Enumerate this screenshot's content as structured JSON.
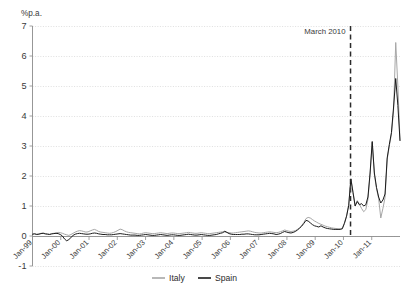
{
  "chart_data": {
    "type": "line",
    "title": "",
    "subtitle": "",
    "xlabel": "",
    "ylabel": "%p.a.",
    "y_unit_label": "%p.a.",
    "ylim": [
      -1,
      7
    ],
    "yticks": [
      -1,
      0,
      1,
      2,
      3,
      4,
      5,
      6,
      7
    ],
    "ytick_labels": [
      "-1",
      "0",
      "1",
      "2",
      "3",
      "4",
      "5",
      "6",
      "7"
    ],
    "grid": "horizontal-dotted",
    "legend_position": "bottom-center",
    "xlim": [
      "Jan-99",
      "Dec-11"
    ],
    "xticks": [
      "Jan-99",
      "Jan-00",
      "Jan-01",
      "Jan-02",
      "Jan-03",
      "Jan-04",
      "Jan-05",
      "Jan-06",
      "Jan-07",
      "Jan-08",
      "Jan-09",
      "Jan-10",
      "Jan-11"
    ],
    "x_start_year": 1999,
    "x_end_year": 2012,
    "annotations": [
      {
        "text": "March 2010",
        "x": "Mar-10",
        "x_fraction": 0.8654,
        "style": "dashed-vertical-line"
      }
    ],
    "series": [
      {
        "name": "Italy",
        "color": "#a6a6a6",
        "values": [
          0.07,
          0.08,
          0.06,
          0.07,
          0.09,
          0.1,
          0.08,
          0.07,
          0.06,
          0.08,
          0.09,
          0.1,
          0.12,
          0.11,
          0.09,
          0.06,
          0.04,
          0.02,
          0.05,
          0.09,
          0.13,
          0.16,
          0.18,
          0.17,
          0.15,
          0.13,
          0.14,
          0.17,
          0.2,
          0.22,
          0.19,
          0.15,
          0.13,
          0.12,
          0.11,
          0.1,
          0.09,
          0.1,
          0.12,
          0.15,
          0.19,
          0.23,
          0.21,
          0.17,
          0.14,
          0.12,
          0.11,
          0.1,
          0.09,
          0.08,
          0.07,
          0.08,
          0.1,
          0.11,
          0.1,
          0.09,
          0.08,
          0.08,
          0.09,
          0.1,
          0.11,
          0.1,
          0.09,
          0.08,
          0.09,
          0.1,
          0.1,
          0.09,
          0.08,
          0.08,
          0.09,
          0.1,
          0.11,
          0.12,
          0.11,
          0.1,
          0.09,
          0.09,
          0.1,
          0.11,
          0.1,
          0.09,
          0.08,
          0.08,
          0.09,
          0.1,
          0.11,
          0.12,
          0.13,
          0.14,
          0.13,
          0.12,
          0.11,
          0.1,
          0.1,
          0.11,
          0.12,
          0.13,
          0.14,
          0.15,
          0.16,
          0.17,
          0.16,
          0.14,
          0.12,
          0.11,
          0.1,
          0.1,
          0.11,
          0.12,
          0.13,
          0.14,
          0.13,
          0.12,
          0.11,
          0.12,
          0.14,
          0.17,
          0.2,
          0.18,
          0.16,
          0.15,
          0.16,
          0.18,
          0.22,
          0.28,
          0.35,
          0.45,
          0.58,
          0.62,
          0.6,
          0.55,
          0.5,
          0.46,
          0.42,
          0.39,
          0.36,
          0.33,
          0.31,
          0.29,
          0.27,
          0.26,
          0.25,
          0.24,
          0.24,
          0.26,
          0.44,
          0.68,
          1.05,
          1.92,
          1.48,
          1.02,
          1.18,
          1.06,
          0.92,
          0.81,
          0.88,
          1.22,
          2.05,
          3.12,
          2.05,
          1.58,
          1.25,
          0.6,
          0.92,
          1.28,
          2.55,
          3.0,
          3.4,
          4.2,
          6.45,
          5.0,
          3.2
        ]
      },
      {
        "name": "Spain",
        "color": "#1b1b1b",
        "values": [
          0.06,
          0.07,
          0.05,
          0.06,
          0.08,
          0.09,
          0.07,
          0.06,
          0.05,
          0.07,
          0.08,
          0.09,
          0.08,
          0.05,
          0.0,
          -0.1,
          -0.16,
          -0.12,
          -0.05,
          0.02,
          0.06,
          0.08,
          0.09,
          0.08,
          0.07,
          0.06,
          0.06,
          0.07,
          0.09,
          0.1,
          0.09,
          0.07,
          0.06,
          0.05,
          0.05,
          0.04,
          0.04,
          0.04,
          0.05,
          0.06,
          0.07,
          0.08,
          0.07,
          0.06,
          0.05,
          0.04,
          0.03,
          0.03,
          0.03,
          0.02,
          0.02,
          0.03,
          0.04,
          0.05,
          0.04,
          0.03,
          0.02,
          0.02,
          0.03,
          0.04,
          0.05,
          0.04,
          0.03,
          0.02,
          0.03,
          0.04,
          0.04,
          0.03,
          0.02,
          0.02,
          0.03,
          0.04,
          0.05,
          0.06,
          0.05,
          0.04,
          0.03,
          0.03,
          0.04,
          0.05,
          0.04,
          0.03,
          0.02,
          0.02,
          0.03,
          0.04,
          0.05,
          0.07,
          0.09,
          0.11,
          0.16,
          0.12,
          0.08,
          0.06,
          0.05,
          0.05,
          0.05,
          0.05,
          0.06,
          0.06,
          0.07,
          0.07,
          0.06,
          0.05,
          0.04,
          0.04,
          0.04,
          0.05,
          0.06,
          0.07,
          0.08,
          0.09,
          0.08,
          0.07,
          0.05,
          0.06,
          0.08,
          0.12,
          0.15,
          0.13,
          0.11,
          0.1,
          0.12,
          0.15,
          0.2,
          0.26,
          0.33,
          0.42,
          0.52,
          0.5,
          0.44,
          0.38,
          0.34,
          0.32,
          0.3,
          0.34,
          0.3,
          0.27,
          0.25,
          0.24,
          0.23,
          0.22,
          0.22,
          0.22,
          0.22,
          0.24,
          0.42,
          0.66,
          1.02,
          1.9,
          1.45,
          1.0,
          1.15,
          1.04,
          1.08,
          1.0,
          1.04,
          1.3,
          2.1,
          3.15,
          2.1,
          1.62,
          1.3,
          1.1,
          1.2,
          1.4,
          2.6,
          3.05,
          3.45,
          4.3,
          5.25,
          4.35,
          3.18
        ]
      }
    ]
  },
  "legend": {
    "items": [
      {
        "label": "Italy",
        "color": "#a6a6a6"
      },
      {
        "label": "Spain",
        "color": "#1b1b1b"
      }
    ]
  },
  "colors": {
    "italy": "#a6a6a6",
    "spain": "#1b1b1b",
    "grid": "#c9c9c9",
    "axis": "#8b8b8b",
    "annotation": "#2b2b2b",
    "background": "#ffffff"
  }
}
